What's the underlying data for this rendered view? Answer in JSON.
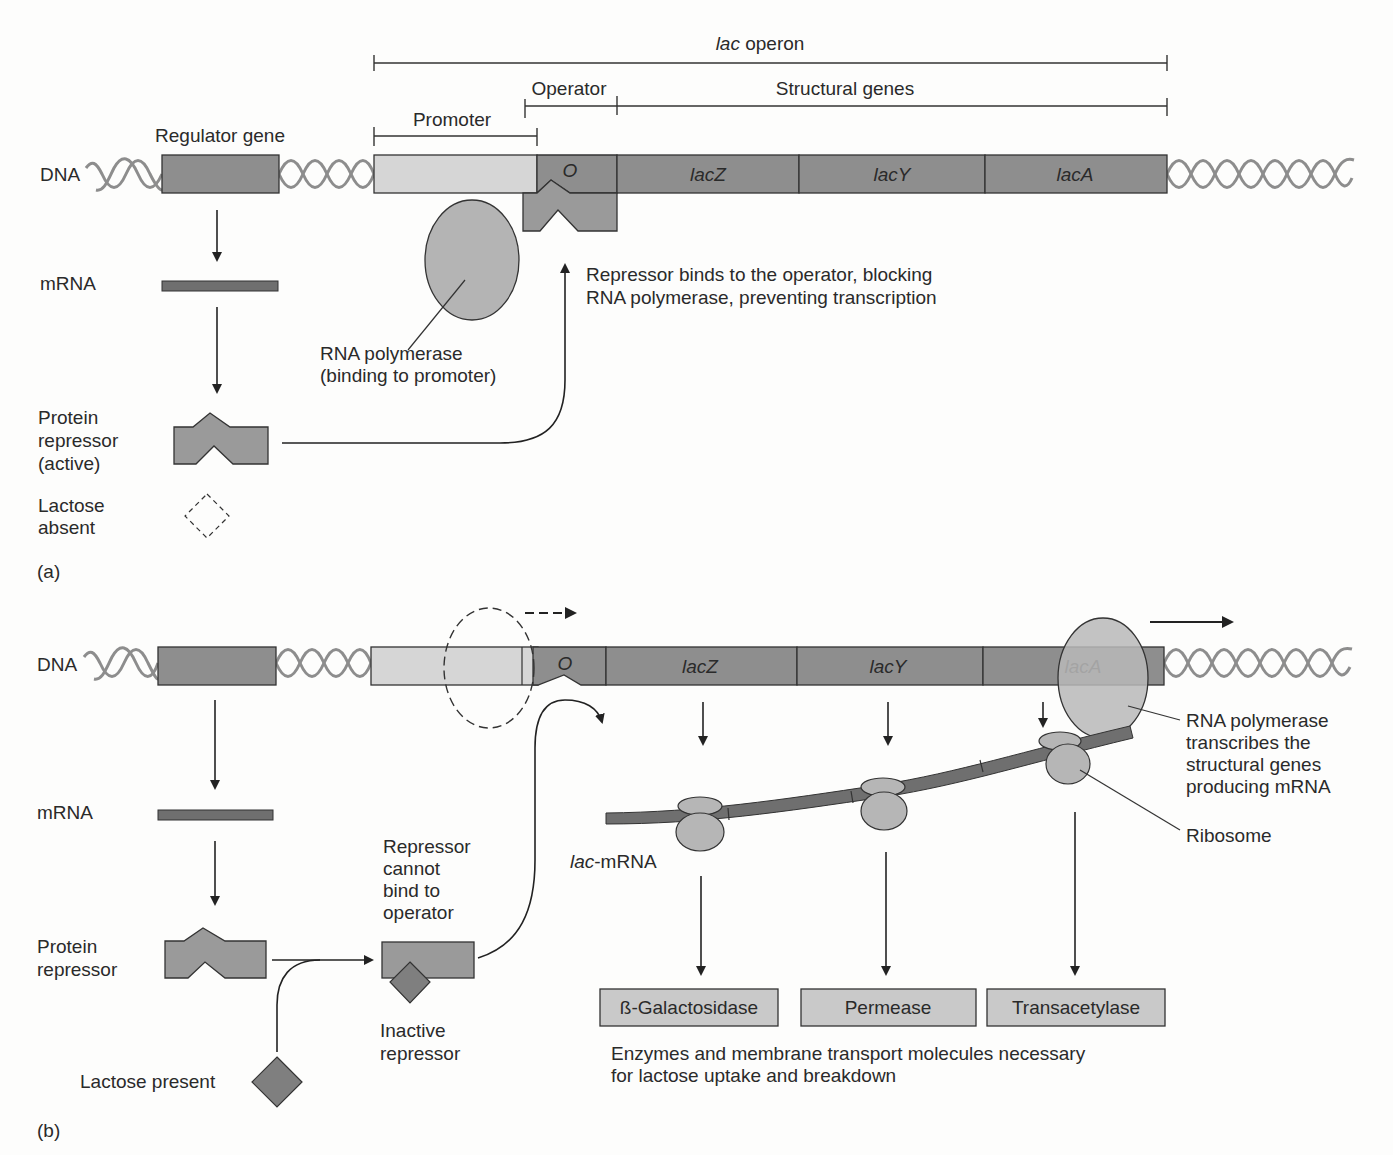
{
  "panel_a": {
    "panel_label": "(a)",
    "lac_operon_label_italic": "lac",
    "lac_operon_label_rest": " operon",
    "operator_label": "Operator",
    "structural_genes_label": "Structural genes",
    "promoter_label": "Promoter",
    "regulator_gene_label": "Regulator gene",
    "dna_label": "DNA",
    "operator_symbol": "O",
    "genes": [
      "lacZ",
      "lacY",
      "lacA"
    ],
    "mrna_label": "mRNA",
    "protein_repressor_label": [
      "Protein",
      "repressor",
      "(active)"
    ],
    "lactose_label": [
      "Lactose",
      "absent"
    ],
    "rna_polymerase_label": [
      "RNA polymerase",
      "(binding to promoter)"
    ],
    "repressor_note": [
      "Repressor binds to the operator, blocking",
      "RNA polymerase, preventing transcription"
    ]
  },
  "panel_b": {
    "panel_label": "(b)",
    "dna_label": "DNA",
    "operator_symbol": "O",
    "genes": [
      "lacZ",
      "lacY",
      "lacA"
    ],
    "mrna_label": "mRNA",
    "protein_repressor_label": [
      "Protein",
      "repressor"
    ],
    "lactose_present_label": "Lactose present",
    "repressor_cannot_bind_label": [
      "Repressor",
      "cannot",
      "bind to",
      "operator"
    ],
    "inactive_repressor_label": [
      "Inactive",
      "repressor"
    ],
    "lac_mrna_label_italic": "lac",
    "lac_mrna_label_rest": "-mRNA",
    "rna_polymerase_note": [
      "RNA polymerase",
      "transcribes the",
      "structural genes",
      "producing mRNA"
    ],
    "ribosome_label": "Ribosome",
    "enzymes": [
      "ß-Galactosidase",
      "Permease",
      "Transacetylase"
    ],
    "enzymes_note": [
      "Enzymes and membrane transport molecules necessary",
      "for lactose uptake and breakdown"
    ]
  },
  "colors": {
    "background": "#fdfdfc",
    "gene_dark": "#8e8e8e",
    "promoter_light": "#d6d6d6",
    "helix": "#8d8d8d",
    "mrna": "#6f6f6f",
    "enzyme_box": "#c9c9c9"
  }
}
